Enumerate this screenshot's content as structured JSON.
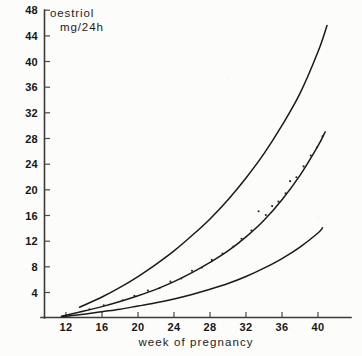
{
  "chart_data": {
    "type": "line",
    "title_line1": "oestriol",
    "title_line2": "mg/24h",
    "xlabel": "week of pregnancy",
    "ylabel": "oestriol mg/24h",
    "xlim": [
      10,
      42
    ],
    "ylim": [
      0,
      48
    ],
    "xticks": [
      12,
      16,
      20,
      24,
      28,
      32,
      36,
      40
    ],
    "yticks": [
      4,
      8,
      12,
      16,
      20,
      24,
      28,
      32,
      36,
      40,
      44,
      48
    ],
    "grid": false,
    "legend": "none",
    "series": [
      {
        "name": "upper reference curve",
        "x": [
          13.5,
          16,
          18,
          20,
          22,
          24,
          26,
          28,
          30,
          32,
          34,
          36,
          38,
          40,
          41
        ],
        "values": [
          1.6,
          3.2,
          4.7,
          6.4,
          8.3,
          10.4,
          12.8,
          15.4,
          18.4,
          21.8,
          25.6,
          30.0,
          35.0,
          41.5,
          45.6
        ]
      },
      {
        "name": "median reference curve",
        "x": [
          11.5,
          14,
          16,
          18,
          20,
          22,
          24,
          26,
          28,
          30,
          32,
          34,
          36,
          38,
          40,
          40.8
        ],
        "values": [
          0.2,
          1.0,
          1.7,
          2.5,
          3.4,
          4.4,
          5.6,
          7.0,
          8.6,
          10.4,
          12.6,
          15.2,
          18.4,
          22.2,
          26.8,
          29.0
        ]
      },
      {
        "name": "lower reference curve",
        "x": [
          11.5,
          14,
          16,
          18,
          20,
          22,
          24,
          26,
          28,
          30,
          32,
          34,
          36,
          38,
          40,
          40.5
        ],
        "values": [
          0.1,
          0.5,
          0.9,
          1.3,
          1.8,
          2.3,
          2.9,
          3.6,
          4.4,
          5.3,
          6.4,
          7.7,
          9.2,
          11.0,
          13.2,
          14.0
        ]
      }
    ],
    "scatter": {
      "name": "measured oestriol values",
      "points": [
        {
          "x": 14.6,
          "y": 1.3
        },
        {
          "x": 16.2,
          "y": 1.9
        },
        {
          "x": 18.3,
          "y": 2.7
        },
        {
          "x": 19.6,
          "y": 3.4
        },
        {
          "x": 21.1,
          "y": 4.2
        },
        {
          "x": 22.4,
          "y": 4.6
        },
        {
          "x": 23.6,
          "y": 5.6
        },
        {
          "x": 24.8,
          "y": 6.1
        },
        {
          "x": 26.0,
          "y": 7.3
        },
        {
          "x": 27.1,
          "y": 7.8
        },
        {
          "x": 28.2,
          "y": 9.0
        },
        {
          "x": 29.4,
          "y": 10.0
        },
        {
          "x": 30.6,
          "y": 11.1
        },
        {
          "x": 31.5,
          "y": 12.3
        },
        {
          "x": 32.6,
          "y": 13.6
        },
        {
          "x": 33.4,
          "y": 16.6
        },
        {
          "x": 34.2,
          "y": 16.0
        },
        {
          "x": 34.9,
          "y": 17.4
        },
        {
          "x": 35.6,
          "y": 18.1
        },
        {
          "x": 36.4,
          "y": 19.4
        },
        {
          "x": 36.9,
          "y": 21.3
        },
        {
          "x": 37.6,
          "y": 21.9
        },
        {
          "x": 38.4,
          "y": 23.6
        },
        {
          "x": 39.2,
          "y": 25.3
        },
        {
          "x": 39.9,
          "y": 26.6
        },
        {
          "x": 40.5,
          "y": 28.3
        }
      ]
    }
  },
  "axis": {
    "y_tick_labels": [
      "48",
      "44",
      "40",
      "36",
      "32",
      "28",
      "24",
      "20",
      "16",
      "12",
      "8",
      "4"
    ],
    "x_tick_labels": [
      "12",
      "16",
      "20",
      "24",
      "28",
      "32",
      "36",
      "40"
    ]
  }
}
